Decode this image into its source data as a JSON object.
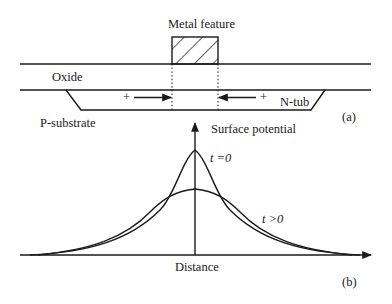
{
  "diagram": {
    "panel_a": {
      "metal_label": "Metal feature",
      "oxide_label": "Oxide",
      "ntub_label": "N-tub",
      "substrate_label": "P-substrate",
      "left_charge": "+",
      "right_charge": "+",
      "panel_label": "(a)"
    },
    "panel_b": {
      "y_axis_label": "Surface potential",
      "x_axis_label": "Distance",
      "curve_t0_label": "t =0",
      "curve_tpos_label": "t >0",
      "panel_label": "(b)"
    }
  }
}
